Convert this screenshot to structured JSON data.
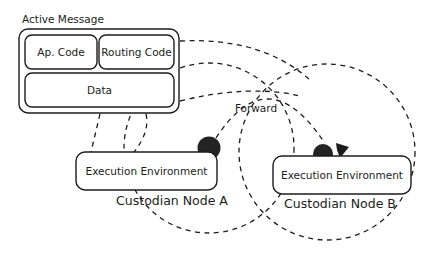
{
  "diagram": {
    "background_color": "#ffffff",
    "stroke_color": "#1c1c1c",
    "dot_color": "#232323"
  },
  "active_message": {
    "title": "Active Message",
    "blocks": [
      {
        "label": "Ap. Code"
      },
      {
        "label": "Routing Code"
      },
      {
        "label": "Data"
      }
    ]
  },
  "nodes": [
    {
      "id": "node-a",
      "name": "Custodian Node A",
      "environment_label": "Execution Environment",
      "dot_name": "active-message-dot",
      "range_name": "radio-range-circle-a"
    },
    {
      "id": "node-b",
      "name": "Custodian Node B",
      "environment_label": "Execution Environment",
      "dot_name": "active-message-dot",
      "range_name": "radio-range-circle-b"
    }
  ],
  "flows": [
    {
      "label": "Forward",
      "from": "Custodian Node A",
      "to": "Custodian Node B"
    }
  ]
}
